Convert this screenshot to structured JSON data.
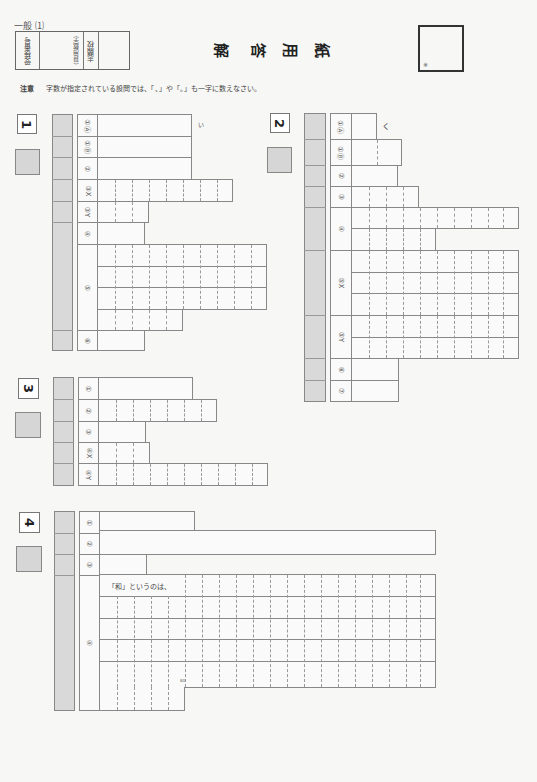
{
  "header": {
    "exam_label": "一般 ⑴",
    "examinee_number_label": "受検番号",
    "numeral_note": "(算用数字)",
    "school_label": "志願校",
    "title_chars": [
      "解",
      "答",
      "用",
      "紙"
    ],
    "note_label": "注意",
    "note_text": "字数が指定されている設問では、「、」や「。」も一字に数えなさい。",
    "total_score_mark": "※"
  },
  "sections": [
    {
      "number": "1",
      "rows": [
        {
          "label": "①Ⓐ",
          "type": "blank"
        },
        {
          "label": "①Ⓑ",
          "type": "blank",
          "suffix": "い"
        },
        {
          "label": "②",
          "type": "blank"
        },
        {
          "label": "③X",
          "type": "grid",
          "cells": 8
        },
        {
          "label": "③Y",
          "type": "grid",
          "cells": 3
        },
        {
          "label": "④",
          "type": "blank"
        },
        {
          "label": "⑤",
          "type": "grid-multi",
          "lines": 4,
          "cells": 10
        },
        {
          "label": "⑥",
          "type": "blank"
        }
      ]
    },
    {
      "number": "2",
      "rows": [
        {
          "label": "①Ⓐ",
          "type": "blank",
          "suffix": "く"
        },
        {
          "label": "①Ⓑ",
          "type": "grid",
          "cells": 2
        },
        {
          "label": "②",
          "type": "blank"
        },
        {
          "label": "③",
          "type": "grid",
          "cells": 4
        },
        {
          "label": "④",
          "type": "grid-multi",
          "lines": 2,
          "cells": 10
        },
        {
          "label": "⑤X",
          "type": "grid-multi",
          "lines": 3,
          "cells": 10
        },
        {
          "label": "⑤Y",
          "type": "grid-multi",
          "lines": 2,
          "cells": 10
        },
        {
          "label": "⑥",
          "type": "blank"
        },
        {
          "label": "⑦",
          "type": "blank"
        }
      ]
    },
    {
      "number": "3",
      "rows": [
        {
          "label": "①",
          "type": "blank"
        },
        {
          "label": "②",
          "type": "grid",
          "cells": 7
        },
        {
          "label": "③",
          "type": "blank"
        },
        {
          "label": "④X",
          "type": "grid",
          "cells": 3
        },
        {
          "label": "④Y",
          "type": "grid",
          "cells": 10
        }
      ]
    },
    {
      "number": "4",
      "rows": [
        {
          "label": "①",
          "type": "blank"
        },
        {
          "label": "②",
          "type": "blank"
        },
        {
          "label": "③",
          "type": "blank"
        },
        {
          "label": "④",
          "type": "composition",
          "lines": 6,
          "cells": 20,
          "prompt": "「和」というのは、",
          "limit_mark": "80"
        }
      ]
    }
  ]
}
